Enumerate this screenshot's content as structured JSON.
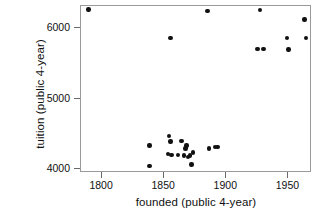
{
  "chart_data": {
    "type": "scatter",
    "title": "",
    "xlabel": "founded (public 4-year)",
    "ylabel": "tuition (public 4-year)",
    "xlim": [
      1783,
      1969
    ],
    "ylim": [
      3940,
      6320
    ],
    "xticks": [
      1800,
      1850,
      1900,
      1950
    ],
    "yticks": [
      4000,
      5000,
      6000
    ],
    "xtick_labels": [
      "1800",
      "1850",
      "1900",
      "1950"
    ],
    "ytick_labels": [
      "4000",
      "5000",
      "6000"
    ],
    "grid": false,
    "legend": null,
    "marker": "filled-circle",
    "marker_color": "#111111",
    "n_points": 28,
    "points": [
      {
        "x": 1789,
        "y": 6270
      },
      {
        "x": 1855,
        "y": 5860
      },
      {
        "x": 1885,
        "y": 6250
      },
      {
        "x": 1927,
        "y": 6260
      },
      {
        "x": 1963,
        "y": 6130
      },
      {
        "x": 1949,
        "y": 5860
      },
      {
        "x": 1964,
        "y": 5860
      },
      {
        "x": 1925,
        "y": 5710
      },
      {
        "x": 1930,
        "y": 5710
      },
      {
        "x": 1950,
        "y": 5700
      },
      {
        "x": 1838,
        "y": 4330
      },
      {
        "x": 1838,
        "y": 4040
      },
      {
        "x": 1854,
        "y": 4470
      },
      {
        "x": 1855,
        "y": 4390
      },
      {
        "x": 1853,
        "y": 4210
      },
      {
        "x": 1856,
        "y": 4195
      },
      {
        "x": 1864,
        "y": 4400
      },
      {
        "x": 1868,
        "y": 4330
      },
      {
        "x": 1867,
        "y": 4290
      },
      {
        "x": 1866,
        "y": 4190
      },
      {
        "x": 1869,
        "y": 4170
      },
      {
        "x": 1871,
        "y": 4190
      },
      {
        "x": 1873,
        "y": 4230
      },
      {
        "x": 1872,
        "y": 4060
      },
      {
        "x": 1886,
        "y": 4290
      },
      {
        "x": 1891,
        "y": 4310
      },
      {
        "x": 1893,
        "y": 4310
      },
      {
        "x": 1861,
        "y": 4200
      }
    ]
  },
  "axes": {
    "ylabel_text": "tuition (public 4-year)",
    "xlabel_text": "founded (public 4-year)"
  }
}
